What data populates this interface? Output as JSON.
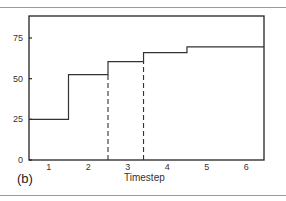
{
  "chart_data": {
    "type": "line",
    "subtype": "step",
    "title": "",
    "panel_label": "(b)",
    "xlabel": "Timestep",
    "ylabel": "",
    "xlim": [
      0.5,
      6.45
    ],
    "ylim": [
      0,
      88
    ],
    "x_ticks": [
      1,
      2,
      3,
      4,
      5,
      6
    ],
    "y_ticks": [
      0,
      25,
      50,
      75
    ],
    "grid": false,
    "legend": null,
    "series": [
      {
        "name": "step",
        "style": "solid",
        "steps": [
          {
            "x_start": 0.5,
            "x_end": 1.5,
            "value": 25
          },
          {
            "x_start": 1.5,
            "x_end": 2.5,
            "value": 52.5
          },
          {
            "x_start": 2.5,
            "x_end": 3.4,
            "value": 60.5
          },
          {
            "x_start": 3.4,
            "x_end": 4.5,
            "value": 66
          },
          {
            "x_start": 4.5,
            "x_end": 6.45,
            "value": 69.5
          }
        ]
      }
    ],
    "annotations": [
      {
        "type": "vertical-dashed-line",
        "x": 2.5,
        "y_from": 0,
        "y_to": 52.5
      },
      {
        "type": "vertical-dashed-line",
        "x": 3.4,
        "y_from": 0,
        "y_to": 60.5
      }
    ]
  },
  "labels": {
    "x_axis_title": "Timestep",
    "panel": "(b)",
    "y_ticks": [
      "0",
      "25",
      "50",
      "75"
    ],
    "x_ticks": [
      "1",
      "2",
      "3",
      "4",
      "5",
      "6"
    ]
  }
}
